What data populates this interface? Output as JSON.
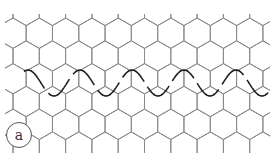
{
  "figure": {
    "panel_label": "a",
    "colors": {
      "lattice": "#8a8a8a",
      "wave": "#222222",
      "background": "#ffffff"
    },
    "lattice": {
      "type": "hexagonal",
      "orientation": "pointy-top",
      "column_pitch_px": 26.3,
      "row_pitch_px": 26,
      "origin_x": 13,
      "origin_y": 18
    },
    "wave": {
      "type": "sinusoid",
      "period_px": 52,
      "amplitude_px": 13,
      "center_y": 83,
      "x_start": 24,
      "x_end": 270
    }
  }
}
